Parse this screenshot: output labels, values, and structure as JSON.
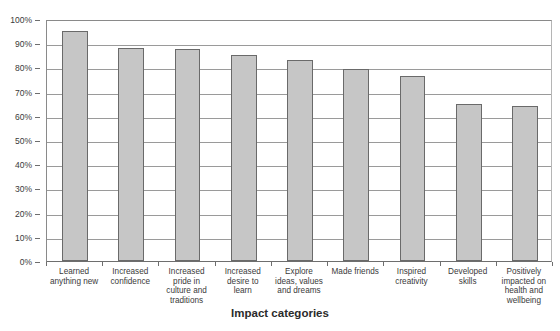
{
  "chart_data": {
    "type": "bar",
    "title": "",
    "xlabel": "Impact categories",
    "ylabel": "",
    "ylim": [
      0,
      100
    ],
    "ytick_labels": [
      "100%",
      "90%",
      "80%",
      "70%",
      "60%",
      "50%",
      "40%",
      "30%",
      "20%",
      "10%",
      "0%"
    ],
    "ytick_values": [
      100,
      90,
      80,
      70,
      60,
      50,
      40,
      30,
      20,
      10,
      0
    ],
    "grid": true,
    "legend": false,
    "bar_fill_color": "#c6c6c6",
    "bar_border_color": "#6a6a6a",
    "categories": [
      "Learned anything new",
      "Increased confidence",
      "Increased pride in culture and traditions",
      "Increased desire to learn",
      "Explore ideas, values and dreams",
      "Made friends",
      "Inspired creativity",
      "Developed skills",
      "Positively impacted on health and wellbeing"
    ],
    "category_lines": [
      [
        "Learned",
        "anything new"
      ],
      [
        "Increased",
        "confidence"
      ],
      [
        "Increased",
        "pride in",
        "culture and",
        "traditions"
      ],
      [
        "Increased",
        "desire to",
        "learn"
      ],
      [
        "Explore",
        "ideas, values",
        "and dreams"
      ],
      [
        "Made friends"
      ],
      [
        "Inspired",
        "creativity"
      ],
      [
        "Developed",
        "skills"
      ],
      [
        "Positively",
        "impacted on",
        "health and",
        "wellbeing"
      ]
    ],
    "values": [
      95,
      88,
      87.5,
      85,
      83,
      79.5,
      76.5,
      65,
      64
    ]
  }
}
